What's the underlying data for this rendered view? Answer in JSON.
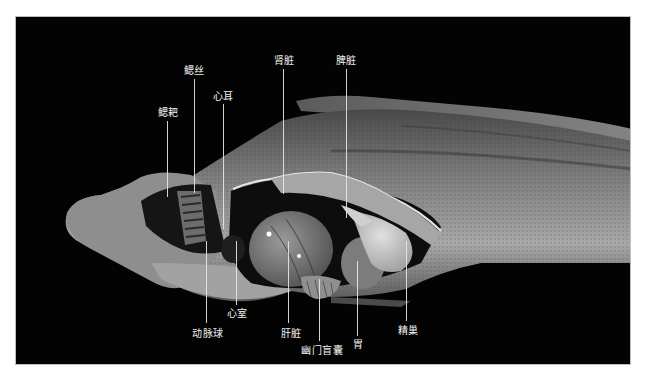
{
  "figure": {
    "background_color": "#030303",
    "label_color": "#f2f2f2",
    "labels": [
      {
        "id": "gill-rakers",
        "text": "鳃耙",
        "x": 167,
        "y": 106,
        "line_x": 166,
        "line_top": 120,
        "line_bottom": 196
      },
      {
        "id": "gill-filaments",
        "text": "鳃丝",
        "x": 193,
        "y": 64,
        "line_x": 193,
        "line_top": 78,
        "line_bottom": 192
      },
      {
        "id": "atrium",
        "text": "心耳",
        "x": 222,
        "y": 90,
        "line_x": 222,
        "line_top": 103,
        "line_bottom": 228
      },
      {
        "id": "kidney",
        "text": "肾脏",
        "x": 283,
        "y": 54,
        "line_x": 282,
        "line_top": 68,
        "line_bottom": 193
      },
      {
        "id": "spleen",
        "text": "脾脏",
        "x": 345,
        "y": 54,
        "line_x": 345,
        "line_top": 68,
        "line_bottom": 217
      },
      {
        "id": "bulbus-arteriosus",
        "text": "动脉球",
        "x": 207,
        "y": 328,
        "line_x": 205,
        "line_top": 240,
        "line_bottom": 322
      },
      {
        "id": "ventricle",
        "text": "心室",
        "x": 236,
        "y": 308,
        "line_x": 235,
        "line_top": 240,
        "line_bottom": 304
      },
      {
        "id": "liver",
        "text": "肝脏",
        "x": 290,
        "y": 328,
        "line_x": 287,
        "line_top": 240,
        "line_bottom": 322
      },
      {
        "id": "pyloric-caeca",
        "text": "幽门盲囊",
        "x": 321,
        "y": 346,
        "line_x": 318,
        "line_top": 278,
        "line_bottom": 340
      },
      {
        "id": "stomach",
        "text": "胃",
        "x": 357,
        "y": 340,
        "line_x": 356,
        "line_top": 260,
        "line_bottom": 335
      },
      {
        "id": "testis",
        "text": "精巢",
        "x": 407,
        "y": 325,
        "line_x": 405,
        "line_top": 240,
        "line_bottom": 320
      }
    ]
  }
}
